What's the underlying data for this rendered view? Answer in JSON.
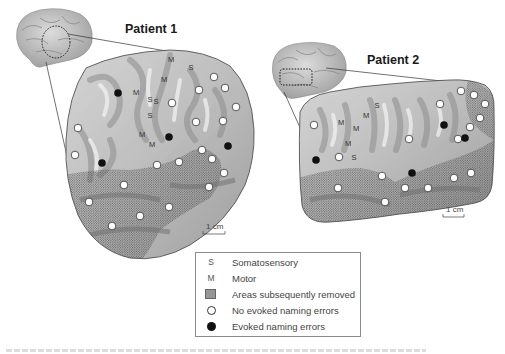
{
  "figure": {
    "panels": [
      {
        "id": "patient-1",
        "title": "Patient 1",
        "scale_label": "1 cm",
        "labels": [
          {
            "t": "M",
            "x": 171,
            "y": 62
          },
          {
            "t": "S",
            "x": 191,
            "y": 70
          },
          {
            "t": "M",
            "x": 164,
            "y": 82
          },
          {
            "t": "M",
            "x": 136,
            "y": 95
          },
          {
            "t": "S",
            "x": 150,
            "y": 102
          },
          {
            "t": "S",
            "x": 156,
            "y": 104
          },
          {
            "t": "S",
            "x": 150,
            "y": 118
          },
          {
            "t": "M",
            "x": 142,
            "y": 137
          },
          {
            "t": "M",
            "x": 152,
            "y": 147
          }
        ],
        "open_sites": [
          {
            "x": 214,
            "y": 77
          },
          {
            "x": 225,
            "y": 88
          },
          {
            "x": 199,
            "y": 90
          },
          {
            "x": 236,
            "y": 107
          },
          {
            "x": 172,
            "y": 103
          },
          {
            "x": 78,
            "y": 128
          },
          {
            "x": 196,
            "y": 122
          },
          {
            "x": 223,
            "y": 121
          },
          {
            "x": 75,
            "y": 155
          },
          {
            "x": 202,
            "y": 150
          },
          {
            "x": 212,
            "y": 159
          },
          {
            "x": 157,
            "y": 165
          },
          {
            "x": 179,
            "y": 162
          },
          {
            "x": 224,
            "y": 173
          },
          {
            "x": 124,
            "y": 185
          },
          {
            "x": 209,
            "y": 187
          },
          {
            "x": 89,
            "y": 202
          },
          {
            "x": 169,
            "y": 207
          },
          {
            "x": 140,
            "y": 216
          },
          {
            "x": 112,
            "y": 226
          }
        ],
        "filled_sites": [
          {
            "x": 118,
            "y": 93
          },
          {
            "x": 169,
            "y": 137
          },
          {
            "x": 228,
            "y": 146
          },
          {
            "x": 102,
            "y": 163
          }
        ]
      },
      {
        "id": "patient-2",
        "title": "Patient 2",
        "scale_label": "1 cm",
        "labels": [
          {
            "t": "S",
            "x": 377,
            "y": 108
          },
          {
            "t": "M",
            "x": 366,
            "y": 118
          },
          {
            "t": "M",
            "x": 341,
            "y": 125
          },
          {
            "t": "M",
            "x": 356,
            "y": 131
          },
          {
            "t": "M",
            "x": 348,
            "y": 146
          },
          {
            "t": "S",
            "x": 354,
            "y": 160
          }
        ],
        "open_sites": [
          {
            "x": 461,
            "y": 91
          },
          {
            "x": 474,
            "y": 95
          },
          {
            "x": 485,
            "y": 104
          },
          {
            "x": 440,
            "y": 104
          },
          {
            "x": 480,
            "y": 118
          },
          {
            "x": 314,
            "y": 125
          },
          {
            "x": 470,
            "y": 127
          },
          {
            "x": 458,
            "y": 139
          },
          {
            "x": 409,
            "y": 139
          },
          {
            "x": 339,
            "y": 157
          },
          {
            "x": 382,
            "y": 176
          },
          {
            "x": 471,
            "y": 173
          },
          {
            "x": 454,
            "y": 178
          },
          {
            "x": 428,
            "y": 188
          },
          {
            "x": 338,
            "y": 188
          },
          {
            "x": 405,
            "y": 188
          },
          {
            "x": 385,
            "y": 202
          }
        ],
        "filled_sites": [
          {
            "x": 444,
            "y": 125
          },
          {
            "x": 465,
            "y": 138
          },
          {
            "x": 316,
            "y": 160
          },
          {
            "x": 412,
            "y": 173
          }
        ]
      }
    ],
    "legend": {
      "items": [
        {
          "symbol": "S",
          "label": "Somatosensory"
        },
        {
          "symbol": "M",
          "label": "Motor"
        },
        {
          "symbol": "stipple",
          "label": "Areas subsequently removed"
        },
        {
          "symbol": "open-circle",
          "label": "No evoked naming errors"
        },
        {
          "symbol": "filled-circle",
          "label": "Evoked naming errors"
        }
      ]
    },
    "colors": {
      "cortex_light": "#e6e6e6",
      "cortex_dark": "#7a7a7a",
      "stipple": "#4a4a4a",
      "outline": "#333333",
      "filled_site": "#111111"
    }
  }
}
